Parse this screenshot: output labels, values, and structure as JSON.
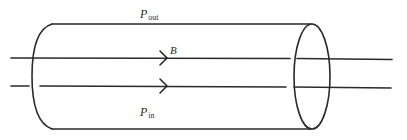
{
  "diagram": {
    "type": "cylinder-flux-tube",
    "labels": {
      "pressure_outside": {
        "symbol": "P",
        "subscript": "out"
      },
      "magnetic_field": {
        "symbol": "B"
      },
      "pressure_inside": {
        "symbol": "P",
        "subscript": "in"
      }
    },
    "field_lines": [
      {
        "name": "upper-field-line",
        "direction": "right"
      },
      {
        "name": "lower-field-line",
        "direction": "right"
      }
    ],
    "colors": {
      "stroke": "#2a2a2a",
      "background": "#ffffff"
    }
  }
}
